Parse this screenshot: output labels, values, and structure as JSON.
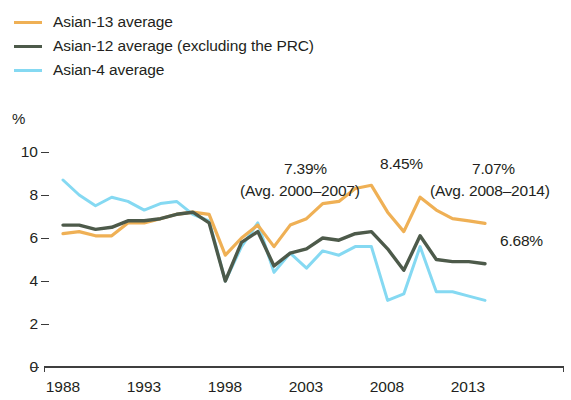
{
  "legend": {
    "items": [
      {
        "label": "Asian-13 average",
        "color": "#efb055",
        "icon": "line-swatch-icon",
        "width": 3.2
      },
      {
        "label": "Asian-12 average (excluding the PRC)",
        "color": "#4d5a4a",
        "icon": "line-swatch-icon",
        "width": 3.6
      },
      {
        "label": "Asian-4 average",
        "color": "#85d9f2",
        "icon": "line-swatch-icon",
        "width": 3.2
      }
    ]
  },
  "axes": {
    "y_unit": "%",
    "y_ticks": [
      "10",
      "8",
      "6",
      "4",
      "2",
      "0"
    ],
    "x_ticks": [
      "1988",
      "1993",
      "1998",
      "2003",
      "2008",
      "2013"
    ]
  },
  "annotations": [
    {
      "name": "annotation-avg-2000-2007-value",
      "text": "7.39%"
    },
    {
      "name": "annotation-avg-2000-2007-range",
      "text": "(Avg. 2000–2007)"
    },
    {
      "name": "annotation-peak-2007",
      "text": "8.45%"
    },
    {
      "name": "annotation-avg-2008-2014-value",
      "text": "7.07%"
    },
    {
      "name": "annotation-avg-2008-2014-range",
      "text": "(Avg. 2008–2014)"
    },
    {
      "name": "annotation-endpoint-2014",
      "text": "6.68%"
    }
  ],
  "chart_data": {
    "type": "line",
    "title": "",
    "xlabel": "",
    "ylabel": "%",
    "xlim": [
      1988,
      2014
    ],
    "ylim": [
      0,
      10
    ],
    "grid": false,
    "legend_position": "top-left",
    "x": [
      1988,
      1989,
      1990,
      1991,
      1992,
      1993,
      1994,
      1995,
      1996,
      1997,
      1998,
      1999,
      2000,
      2001,
      2002,
      2003,
      2004,
      2005,
      2006,
      2007,
      2008,
      2009,
      2010,
      2011,
      2012,
      2013,
      2014
    ],
    "series": [
      {
        "name": "Asian-13 average",
        "color": "#efb055",
        "values": [
          6.2,
          6.3,
          6.1,
          6.1,
          6.7,
          6.7,
          6.9,
          7.1,
          7.2,
          7.1,
          5.2,
          6.0,
          6.6,
          5.6,
          6.6,
          6.9,
          7.6,
          7.7,
          8.3,
          8.45,
          7.2,
          6.3,
          7.9,
          7.3,
          6.9,
          6.8,
          6.68
        ]
      },
      {
        "name": "Asian-12 average (excluding the PRC)",
        "color": "#4d5a4a",
        "values": [
          6.6,
          6.6,
          6.4,
          6.5,
          6.8,
          6.8,
          6.9,
          7.1,
          7.2,
          6.7,
          4.0,
          5.8,
          6.3,
          4.7,
          5.3,
          5.5,
          6.0,
          5.9,
          6.2,
          6.3,
          5.5,
          4.5,
          6.1,
          5.0,
          4.9,
          4.9,
          4.8
        ]
      },
      {
        "name": "Asian-4 average",
        "color": "#85d9f2",
        "values": [
          8.7,
          8.0,
          7.5,
          7.9,
          7.7,
          7.3,
          7.6,
          7.7,
          7.1,
          6.8,
          4.0,
          5.6,
          6.7,
          4.4,
          5.3,
          4.6,
          5.4,
          5.2,
          5.6,
          5.6,
          3.1,
          3.4,
          5.6,
          3.5,
          3.5,
          3.3,
          3.1
        ]
      }
    ]
  }
}
